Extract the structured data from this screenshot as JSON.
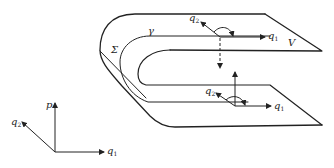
{
  "diagram": {
    "type": "folded-surface-phase-space",
    "stroke_color": "#222222",
    "background": "#ffffff",
    "labels": {
      "sigma": "Σ",
      "gamma": "γ",
      "V": "V",
      "upper_q2": "q",
      "upper_q2_sub": "2",
      "upper_q1": "q",
      "upper_q1_sub": "1",
      "lower_q2": "q",
      "lower_q2_sub": "2",
      "lower_q1": "q",
      "lower_q1_sub": "1",
      "axis_p": "p",
      "axis_q2": "q",
      "axis_q2_sub": "2",
      "axis_q1": "q",
      "axis_q1_sub": "1"
    }
  }
}
